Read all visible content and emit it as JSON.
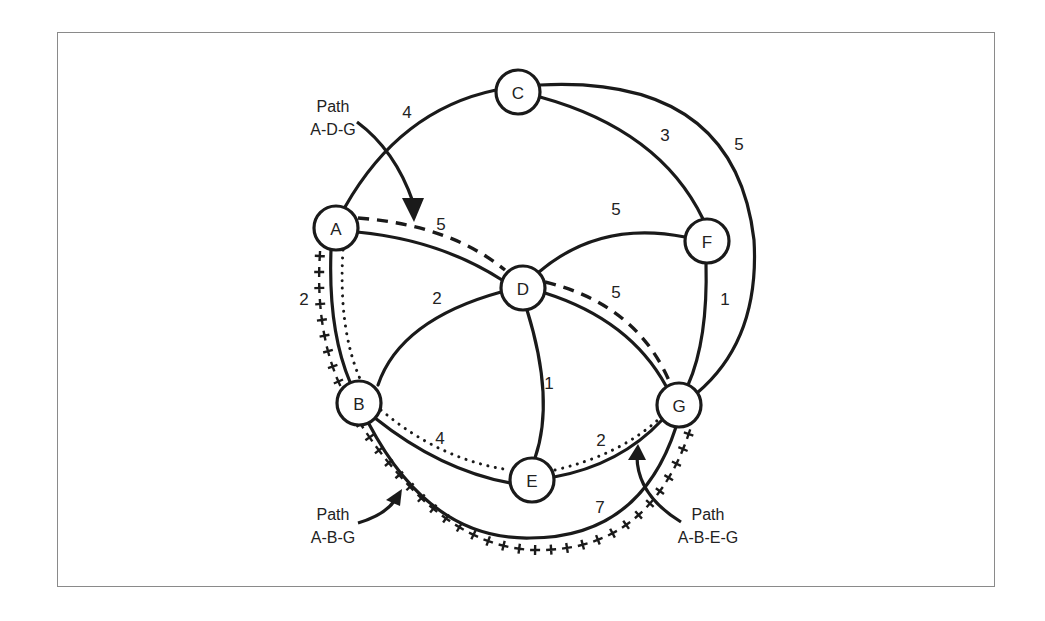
{
  "diagram": {
    "type": "weighted-network-graph",
    "nodes": [
      {
        "id": "A",
        "label": "A",
        "x": 336,
        "y": 228
      },
      {
        "id": "B",
        "label": "B",
        "x": 359,
        "y": 403
      },
      {
        "id": "C",
        "label": "C",
        "x": 518,
        "y": 92
      },
      {
        "id": "D",
        "label": "D",
        "x": 523,
        "y": 288
      },
      {
        "id": "E",
        "label": "E",
        "x": 532,
        "y": 480
      },
      {
        "id": "F",
        "label": "F",
        "x": 707,
        "y": 241
      },
      {
        "id": "G",
        "label": "G",
        "x": 679,
        "y": 405
      }
    ],
    "edges": [
      {
        "from": "A",
        "to": "C",
        "weight": "4"
      },
      {
        "from": "A",
        "to": "D",
        "weight": "5"
      },
      {
        "from": "A",
        "to": "B",
        "weight": "2"
      },
      {
        "from": "C",
        "to": "F",
        "weight": "3"
      },
      {
        "from": "C",
        "to": "G",
        "weight": "5"
      },
      {
        "from": "D",
        "to": "F",
        "weight": "5"
      },
      {
        "from": "D",
        "to": "B",
        "weight": "2"
      },
      {
        "from": "D",
        "to": "E",
        "weight": "1"
      },
      {
        "from": "D",
        "to": "G",
        "weight": "5"
      },
      {
        "from": "F",
        "to": "G",
        "weight": "1"
      },
      {
        "from": "B",
        "to": "E",
        "weight": "4"
      },
      {
        "from": "E",
        "to": "G",
        "weight": "2"
      },
      {
        "from": "B",
        "to": "G",
        "weight": "7"
      }
    ],
    "paths": [
      {
        "name": "A-D-G",
        "label_line1": "Path",
        "label_line2": "A-D-G",
        "style": "dashed",
        "total": "10"
      },
      {
        "name": "A-B-G",
        "label_line1": "Path",
        "label_line2": "A-B-G",
        "style": "plus-marks",
        "total": "9"
      },
      {
        "name": "A-B-E-G",
        "label_line1": "Path",
        "label_line2": "A-B-E-G",
        "style": "dotted",
        "total": "8"
      }
    ]
  },
  "labels": {
    "nodes": {
      "A": "A",
      "B": "B",
      "C": "C",
      "D": "D",
      "E": "E",
      "F": "F",
      "G": "G"
    },
    "weights": {
      "AC": "4",
      "AD": "5",
      "AB": "2",
      "CF": "3",
      "CG": "5",
      "DF": "5",
      "DB": "2",
      "DE": "1",
      "DG": "5",
      "FG": "1",
      "BE": "4",
      "EG": "2",
      "BG": "7"
    },
    "annotations": {
      "adg": {
        "line1": "Path",
        "line2": "A-D-G"
      },
      "abg": {
        "line1": "Path",
        "line2": "A-B-G"
      },
      "abeg": {
        "line1": "Path",
        "line2": "A-B-E-G"
      }
    }
  }
}
